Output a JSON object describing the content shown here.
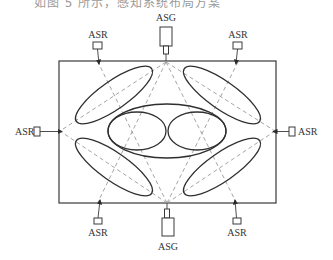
{
  "caption": "如图 5 所示，感知系统布局方案",
  "diagram": {
    "type": "sensor-layout",
    "frame": {
      "x": 59,
      "y": 61,
      "width": 217,
      "height": 142
    },
    "devices": {
      "asg_top": {
        "label": "ASG"
      },
      "asg_bottom": {
        "label": "ASG"
      },
      "asr_top_left": {
        "label": "ASR"
      },
      "asr_top_right": {
        "label": "ASR"
      },
      "asr_left": {
        "label": "ASR"
      },
      "asr_right": {
        "label": "ASR"
      },
      "asr_bottom_left": {
        "label": "ASR"
      },
      "asr_bottom_right": {
        "label": "ASR"
      }
    },
    "colors": {
      "stroke": "#2f2f2f",
      "dashed": "#9a9a9a",
      "background": "#ffffff"
    }
  }
}
